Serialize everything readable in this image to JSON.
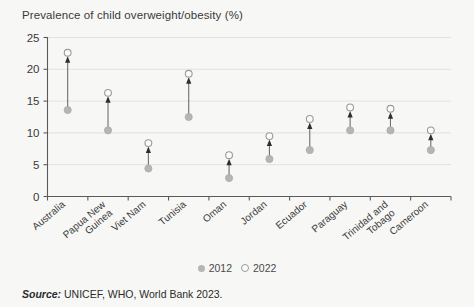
{
  "chart_data": {
    "type": "scatter",
    "title": "Prevalence of child overweight/obesity (%)",
    "xlabel": "",
    "ylabel": "",
    "ylim": [
      0,
      25
    ],
    "yticks": [
      0,
      5,
      10,
      15,
      20,
      25
    ],
    "grid": true,
    "legend_position": "bottom-center",
    "categories": [
      "Australia",
      "Papua New Guinea",
      "Viet Nam",
      "Tunisia",
      "Oman",
      "Jordan",
      "Ecuador",
      "Paraguay",
      "Trinidad and Tobago",
      "Cameroon"
    ],
    "series": [
      {
        "name": "2012",
        "marker": "filled-circle",
        "color": "#b5b5b5",
        "values": [
          13.6,
          10.4,
          4.4,
          12.5,
          2.9,
          5.9,
          7.3,
          10.4,
          10.4,
          7.3
        ]
      },
      {
        "name": "2022",
        "marker": "open-circle",
        "color": "#fbfbf9",
        "values": [
          22.6,
          16.3,
          8.4,
          19.3,
          6.5,
          9.5,
          12.2,
          14.0,
          13.8,
          10.4
        ]
      }
    ],
    "annotations": [
      "upward arrows from 2012 value to 2022 value"
    ]
  },
  "legend": {
    "items": [
      {
        "label": "2012",
        "style": "filled"
      },
      {
        "label": "2022",
        "style": "open"
      }
    ]
  },
  "source": {
    "label": "Source:",
    "text": "UNICEF, WHO, World Bank 2023."
  },
  "colors": {
    "background": "#f7f7f5",
    "axis": "#5a5a5a",
    "grid": "#dcdcd8",
    "dot_2012": "#b5b5b5",
    "dot_2022_stroke": "#9a9a9a",
    "arrow": "#2e2e2e",
    "text": "#2b2b2b"
  }
}
